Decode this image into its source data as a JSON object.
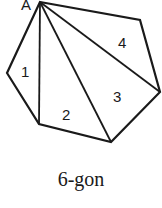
{
  "figure": {
    "vertex_label": "A",
    "region_labels": [
      "1",
      "2",
      "3",
      "4"
    ],
    "caption": "6-gon",
    "stroke_color": "#1a1a1a"
  }
}
